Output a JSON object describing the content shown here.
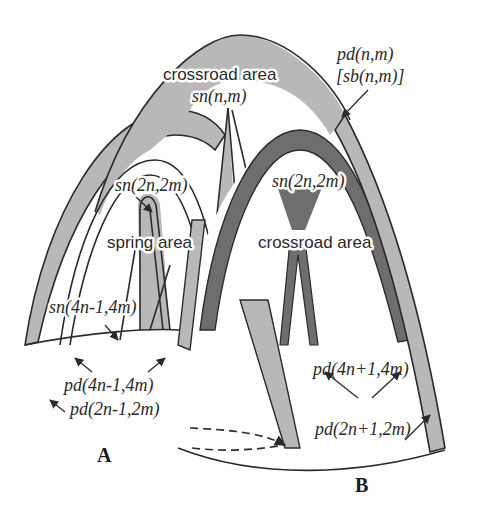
{
  "figure": {
    "colors": {
      "light_band": "#b8b8b8",
      "dark_band": "#6e6e6e",
      "outline": "#2b2b2b",
      "background": "#ffffff"
    },
    "labels": {
      "outer_arch": "pd(n,m)",
      "outer_arch_alt": "[sb(n,m)]",
      "top_crossroad_title": "crossroad area",
      "top_crossroad_sub": "sn(n,m)",
      "left_inner_top": "sn(2n,2m)",
      "spring_area": "spring area",
      "left_inner_side": "sn(4n-1,4m)",
      "left_pd_inner": "pd(4n-1,4m)",
      "left_pd_outer": "pd(2n-1,2m)",
      "right_inner_top": "sn(2n,2m)",
      "right_crossroad": "crossroad area",
      "right_pd_inner": "pd(4n+1,4m)",
      "right_pd_outer": "pd(2n+1,2m)",
      "part_a": "A",
      "part_b": "B"
    }
  }
}
